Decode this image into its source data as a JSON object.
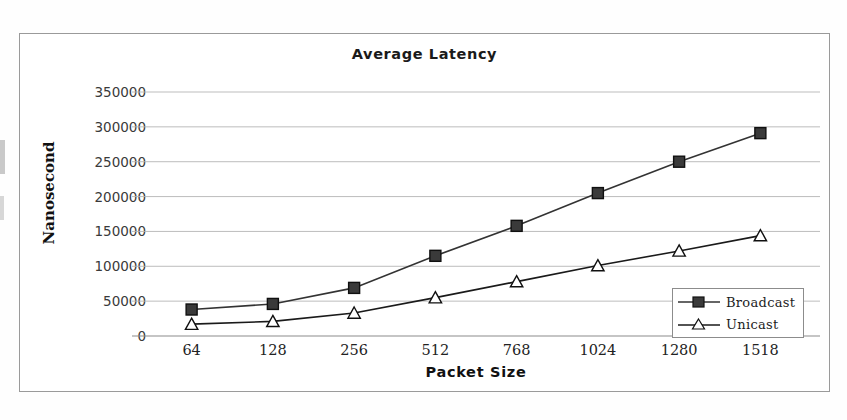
{
  "chart_data": {
    "type": "line",
    "title": "Average Latency",
    "xlabel": "Packet Size",
    "ylabel": "Nanosecond",
    "categories": [
      "64",
      "128",
      "256",
      "512",
      "768",
      "1024",
      "1280",
      "1518"
    ],
    "series": [
      {
        "name": "Broadcast",
        "marker": "filled-square",
        "color": "#333333",
        "values": [
          38000,
          46000,
          69000,
          115000,
          158000,
          205000,
          250000,
          291000
        ]
      },
      {
        "name": "Unicast",
        "marker": "open-triangle",
        "color": "#1a1a1a",
        "values": [
          17000,
          21000,
          33000,
          55000,
          78000,
          101000,
          122000,
          144000
        ]
      }
    ],
    "ylim": [
      0,
      350000
    ],
    "y_ticks": [
      "0",
      "50000",
      "100000",
      "150000",
      "200000",
      "250000",
      "300000",
      "350000"
    ],
    "y_tick_values": [
      0,
      50000,
      100000,
      150000,
      200000,
      250000,
      300000,
      350000
    ],
    "grid": true,
    "legend_position": "bottom-right",
    "gridline_color": "#b6b6b6",
    "axis_color": "#8c8c8c",
    "frame_color": "#9a9a9a"
  },
  "legend": {
    "items": [
      {
        "label": "Broadcast"
      },
      {
        "label": "Unicast"
      }
    ]
  }
}
